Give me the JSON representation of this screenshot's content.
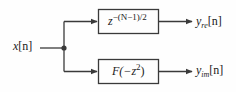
{
  "diagram": {
    "background_color": "#fefefe",
    "line_color": "#3a3a3a",
    "text_color": "#1a1a1a",
    "input": {
      "label_base": "x",
      "label_index": "[n]"
    },
    "junction": {
      "name": "branch-point",
      "x": 64,
      "y": 48
    },
    "blocks": [
      {
        "id": "top",
        "expr_plain": "z^-(N-1)/2",
        "expr_base": "z",
        "expr_exponent": "−(N−1)/2",
        "x": 98,
        "y": 9,
        "width": 61,
        "height": 25
      },
      {
        "id": "bottom",
        "expr_plain": "F(-z^2)",
        "expr_prefix": "F(−z",
        "expr_exponent": "2",
        "expr_suffix": ")",
        "x": 98,
        "y": 59,
        "width": 61,
        "height": 25
      }
    ],
    "outputs": [
      {
        "id": "real",
        "label_base": "y",
        "label_sub": "re",
        "label_index": "[n]"
      },
      {
        "id": "imag",
        "label_base": "y",
        "label_sub": "im",
        "label_index": "[n]"
      }
    ]
  }
}
